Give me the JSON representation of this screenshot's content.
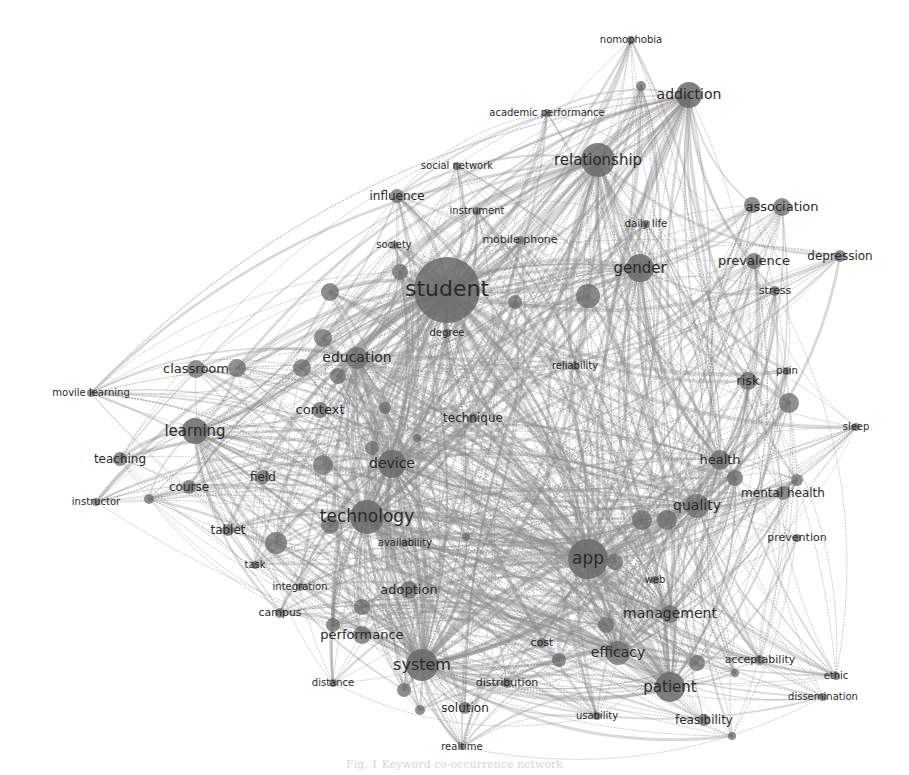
{
  "diagram": {
    "type": "keyword co-occurrence network",
    "colors": {
      "background": "#ffffff",
      "node": "#666666",
      "edge": "#8a8a8a",
      "label": "#2a2a2a"
    },
    "nodes": [
      {
        "id": "student",
        "label": "student",
        "x": 447,
        "y": 290,
        "r": 33,
        "fs": 22
      },
      {
        "id": "relationship",
        "label": "relationship",
        "x": 598,
        "y": 160,
        "r": 17,
        "fs": 15
      },
      {
        "id": "addiction",
        "label": "addiction",
        "x": 689,
        "y": 95,
        "r": 13,
        "fs": 14
      },
      {
        "id": "nomophobia",
        "label": "nomophobia",
        "x": 631,
        "y": 40,
        "r": 4,
        "fs": 10
      },
      {
        "id": "academic-performance",
        "label": "academic performance",
        "x": 547,
        "y": 113,
        "r": 4,
        "fs": 10
      },
      {
        "id": "social-network",
        "label": "social network",
        "x": 457,
        "y": 166,
        "r": 4,
        "fs": 10
      },
      {
        "id": "influence",
        "label": "influence",
        "x": 397,
        "y": 196,
        "r": 7,
        "fs": 12
      },
      {
        "id": "instrument",
        "label": "instrument",
        "x": 477,
        "y": 211,
        "r": 4,
        "fs": 10
      },
      {
        "id": "daily-life",
        "label": "daily life",
        "x": 646,
        "y": 224,
        "r": 4,
        "fs": 10
      },
      {
        "id": "mobile-phone",
        "label": "mobile phone",
        "x": 520,
        "y": 240,
        "r": 4,
        "fs": 11
      },
      {
        "id": "society",
        "label": "society",
        "x": 394,
        "y": 245,
        "r": 4,
        "fs": 10
      },
      {
        "id": "association",
        "label": "association",
        "x": 782,
        "y": 207,
        "r": 9,
        "fs": 13
      },
      {
        "id": "gender",
        "label": "gender",
        "x": 640,
        "y": 268,
        "r": 14,
        "fs": 15
      },
      {
        "id": "prevalence",
        "label": "prevalence",
        "x": 754,
        "y": 261,
        "r": 8,
        "fs": 13
      },
      {
        "id": "depression",
        "label": "depression",
        "x": 840,
        "y": 256,
        "r": 6,
        "fs": 12
      },
      {
        "id": "stress",
        "label": "stress",
        "x": 775,
        "y": 291,
        "r": 5,
        "fs": 11
      },
      {
        "id": "degree",
        "label": "degree",
        "x": 447,
        "y": 333,
        "r": 4,
        "fs": 10
      },
      {
        "id": "reliability",
        "label": "reliability",
        "x": 575,
        "y": 366,
        "r": 4,
        "fs": 10
      },
      {
        "id": "education",
        "label": "education",
        "x": 357,
        "y": 358,
        "r": 11,
        "fs": 14
      },
      {
        "id": "classroom",
        "label": "classroom",
        "x": 196,
        "y": 369,
        "r": 9,
        "fs": 13
      },
      {
        "id": "movile-learning",
        "label": "movile learning",
        "x": 91,
        "y": 393,
        "r": 4,
        "fs": 10
      },
      {
        "id": "context",
        "label": "context",
        "x": 320,
        "y": 410,
        "r": 8,
        "fs": 13
      },
      {
        "id": "technique",
        "label": "technique",
        "x": 473,
        "y": 418,
        "r": 5,
        "fs": 12
      },
      {
        "id": "learning",
        "label": "learning",
        "x": 195,
        "y": 431,
        "r": 13,
        "fs": 15
      },
      {
        "id": "risk",
        "label": "risk",
        "x": 748,
        "y": 381,
        "r": 9,
        "fs": 13
      },
      {
        "id": "pain",
        "label": "pain",
        "x": 787,
        "y": 371,
        "r": 4,
        "fs": 10
      },
      {
        "id": "sleep",
        "label": "sleep",
        "x": 856,
        "y": 427,
        "r": 4,
        "fs": 10
      },
      {
        "id": "teaching",
        "label": "teaching",
        "x": 120,
        "y": 459,
        "r": 7,
        "fs": 12
      },
      {
        "id": "device",
        "label": "device",
        "x": 392,
        "y": 464,
        "r": 14,
        "fs": 14
      },
      {
        "id": "field",
        "label": "field",
        "x": 263,
        "y": 477,
        "r": 7,
        "fs": 12
      },
      {
        "id": "course",
        "label": "course",
        "x": 189,
        "y": 487,
        "r": 7,
        "fs": 12
      },
      {
        "id": "instructor",
        "label": "instructor",
        "x": 96,
        "y": 502,
        "r": 4,
        "fs": 10
      },
      {
        "id": "health",
        "label": "health",
        "x": 720,
        "y": 460,
        "r": 10,
        "fs": 13
      },
      {
        "id": "mental-health",
        "label": "mental health",
        "x": 783,
        "y": 493,
        "r": 7,
        "fs": 12
      },
      {
        "id": "technology",
        "label": "technology",
        "x": 367,
        "y": 517,
        "r": 17,
        "fs": 17
      },
      {
        "id": "quality",
        "label": "quality",
        "x": 697,
        "y": 506,
        "r": 12,
        "fs": 14
      },
      {
        "id": "tablet",
        "label": "tablet",
        "x": 228,
        "y": 530,
        "r": 6,
        "fs": 12
      },
      {
        "id": "availability",
        "label": "availability",
        "x": 405,
        "y": 543,
        "r": 4,
        "fs": 10
      },
      {
        "id": "prevention",
        "label": "prevention",
        "x": 797,
        "y": 538,
        "r": 4,
        "fs": 11
      },
      {
        "id": "app",
        "label": "app",
        "x": 588,
        "y": 559,
        "r": 20,
        "fs": 17
      },
      {
        "id": "task",
        "label": "task",
        "x": 255,
        "y": 565,
        "r": 4,
        "fs": 10
      },
      {
        "id": "web",
        "label": "web",
        "x": 655,
        "y": 580,
        "r": 4,
        "fs": 10
      },
      {
        "id": "integration",
        "label": "integration",
        "x": 300,
        "y": 587,
        "r": 4,
        "fs": 10
      },
      {
        "id": "adoption",
        "label": "adoption",
        "x": 409,
        "y": 590,
        "r": 9,
        "fs": 13
      },
      {
        "id": "campus",
        "label": "campus",
        "x": 280,
        "y": 613,
        "r": 5,
        "fs": 11
      },
      {
        "id": "management",
        "label": "management",
        "x": 670,
        "y": 614,
        "r": 9,
        "fs": 14
      },
      {
        "id": "performance",
        "label": "performance",
        "x": 362,
        "y": 635,
        "r": 9,
        "fs": 13
      },
      {
        "id": "cost",
        "label": "cost",
        "x": 542,
        "y": 643,
        "r": 5,
        "fs": 11
      },
      {
        "id": "efficacy",
        "label": "efficacy",
        "x": 618,
        "y": 653,
        "r": 12,
        "fs": 14
      },
      {
        "id": "system",
        "label": "system",
        "x": 422,
        "y": 665,
        "r": 16,
        "fs": 16
      },
      {
        "id": "acceptability",
        "label": "acceptability",
        "x": 760,
        "y": 660,
        "r": 5,
        "fs": 11
      },
      {
        "id": "ethic",
        "label": "ethic",
        "x": 836,
        "y": 676,
        "r": 4,
        "fs": 10
      },
      {
        "id": "distance",
        "label": "distance",
        "x": 333,
        "y": 683,
        "r": 4,
        "fs": 10
      },
      {
        "id": "distribution",
        "label": "distribution",
        "x": 507,
        "y": 683,
        "r": 5,
        "fs": 11
      },
      {
        "id": "patient",
        "label": "patient",
        "x": 670,
        "y": 687,
        "r": 15,
        "fs": 15
      },
      {
        "id": "dissemination",
        "label": "dissemination",
        "x": 823,
        "y": 697,
        "r": 4,
        "fs": 10
      },
      {
        "id": "solution",
        "label": "solution",
        "x": 465,
        "y": 708,
        "r": 6,
        "fs": 12
      },
      {
        "id": "usability",
        "label": "usability",
        "x": 597,
        "y": 716,
        "r": 4,
        "fs": 10
      },
      {
        "id": "feasibility",
        "label": "feasibility",
        "x": 704,
        "y": 720,
        "r": 6,
        "fs": 12
      },
      {
        "id": "realtime",
        "label": "realtime",
        "x": 462,
        "y": 747,
        "r": 3,
        "fs": 10
      }
    ],
    "unlabeled_nodes": [
      {
        "x": 641,
        "y": 86,
        "r": 5
      },
      {
        "x": 330,
        "y": 292,
        "r": 9
      },
      {
        "x": 400,
        "y": 272,
        "r": 8
      },
      {
        "x": 588,
        "y": 296,
        "r": 12
      },
      {
        "x": 515,
        "y": 302,
        "r": 7
      },
      {
        "x": 323,
        "y": 338,
        "r": 9
      },
      {
        "x": 302,
        "y": 368,
        "r": 9
      },
      {
        "x": 338,
        "y": 376,
        "r": 8
      },
      {
        "x": 385,
        "y": 408,
        "r": 6
      },
      {
        "x": 417,
        "y": 438,
        "r": 4
      },
      {
        "x": 372,
        "y": 448,
        "r": 7
      },
      {
        "x": 323,
        "y": 465,
        "r": 10
      },
      {
        "x": 237,
        "y": 368,
        "r": 9
      },
      {
        "x": 149,
        "y": 499,
        "r": 5
      },
      {
        "x": 276,
        "y": 543,
        "r": 11
      },
      {
        "x": 330,
        "y": 525,
        "r": 9
      },
      {
        "x": 466,
        "y": 537,
        "r": 4
      },
      {
        "x": 362,
        "y": 607,
        "r": 8
      },
      {
        "x": 333,
        "y": 625,
        "r": 7
      },
      {
        "x": 404,
        "y": 690,
        "r": 7
      },
      {
        "x": 559,
        "y": 660,
        "r": 7
      },
      {
        "x": 667,
        "y": 520,
        "r": 10
      },
      {
        "x": 642,
        "y": 520,
        "r": 10
      },
      {
        "x": 615,
        "y": 562,
        "r": 8
      },
      {
        "x": 606,
        "y": 625,
        "r": 8
      },
      {
        "x": 735,
        "y": 673,
        "r": 4
      },
      {
        "x": 789,
        "y": 403,
        "r": 10
      },
      {
        "x": 735,
        "y": 478,
        "r": 8
      },
      {
        "x": 797,
        "y": 480,
        "r": 6
      },
      {
        "x": 732,
        "y": 736,
        "r": 4
      },
      {
        "x": 752,
        "y": 205,
        "r": 8
      },
      {
        "x": 697,
        "y": 663,
        "r": 8
      },
      {
        "x": 420,
        "y": 710,
        "r": 5
      }
    ],
    "hubs": [
      "student",
      "technology",
      "app",
      "device",
      "system",
      "relationship",
      "gender",
      "patient",
      "efficacy",
      "quality",
      "learning",
      "education",
      "addiction",
      "health",
      "management"
    ],
    "caption": "Fig. 1 Keyword co-occurrence network"
  }
}
